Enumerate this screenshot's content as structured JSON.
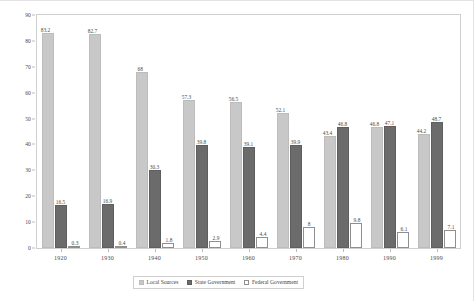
{
  "chart_data": {
    "type": "bar",
    "title": "",
    "subtitle": "",
    "xlabel": "",
    "ylabel": "",
    "ylim": [
      0,
      90
    ],
    "yticks": [
      0,
      10,
      20,
      30,
      40,
      50,
      60,
      70,
      80,
      90
    ],
    "grid": false,
    "legend_position": "bottom",
    "categories": [
      "1920",
      "1930",
      "1940",
      "1950",
      "1960",
      "1970",
      "1980",
      "1990",
      "1999"
    ],
    "series": [
      {
        "name": "Local Sources",
        "color": "#c8c8c8",
        "values": [
          83.2,
          82.7,
          68,
          57.3,
          56.5,
          52.1,
          43.4,
          46.8,
          44.2
        ],
        "labels": [
          "83.2",
          "82.7",
          "68",
          "57.3",
          "56.5",
          "52.1",
          "43.4",
          "46.8",
          "44.2"
        ]
      },
      {
        "name": "State Government",
        "color": "#6b6b6b",
        "values": [
          16.5,
          16.9,
          30.3,
          39.8,
          39.1,
          39.9,
          46.8,
          47.1,
          48.7
        ],
        "labels": [
          "16.5",
          "16.9",
          "30.3",
          "39.8",
          "39.1",
          "39.9",
          "46.8",
          "47.1",
          "48.7"
        ]
      },
      {
        "name": "Federal Government",
        "color": "#ffffff",
        "values": [
          0.3,
          0.4,
          1.8,
          2.9,
          4.4,
          8,
          9.8,
          6.1,
          7.1
        ],
        "labels": [
          "0.3",
          "0.4",
          "1.8",
          "2.9",
          "4.4",
          "8",
          "9.8",
          "6.1",
          "7.1"
        ]
      }
    ]
  },
  "legend": {
    "items": [
      {
        "label": "Local Sources"
      },
      {
        "label": "State Government"
      },
      {
        "label": "Federal Government"
      }
    ]
  },
  "colors": {
    "local": "#c8c8c8",
    "state": "#6b6b6b",
    "federal": "#ffffff",
    "frame": "#cfcfcf",
    "text": "#4a4a4a"
  }
}
